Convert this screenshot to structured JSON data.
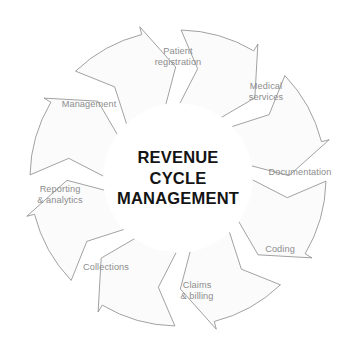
{
  "diagram": {
    "type": "circular-cycle",
    "title_lines": [
      "REVENUE",
      "CYCLE",
      "MANAGEMENT"
    ],
    "center_text": "REVENUE CYCLE MANAGEMENT",
    "direction": "clockwise",
    "segment_count": 8,
    "colors": {
      "arrow_fill": "#fbfbfb",
      "arrow_stroke": "#8a8a8a",
      "label_text": "#8d8d8d",
      "center_text": "#141414",
      "background": "#ffffff"
    },
    "segments": [
      {
        "id": "patient-registration",
        "label_lines": [
          "Patient",
          "registration"
        ],
        "label": "Patient registration",
        "order": 1,
        "label_x": 178,
        "label_y": 57
      },
      {
        "id": "medical-services",
        "label_lines": [
          "Medical",
          "services"
        ],
        "label": "Medical services",
        "order": 2,
        "label_x": 266,
        "label_y": 92
      },
      {
        "id": "documentation",
        "label_lines": [
          "Documentation"
        ],
        "label": "Documentation",
        "order": 3,
        "label_x": 300,
        "label_y": 173
      },
      {
        "id": "coding",
        "label_lines": [
          "Coding"
        ],
        "label": "Coding",
        "order": 4,
        "label_x": 280,
        "label_y": 250
      },
      {
        "id": "claims-billing",
        "label_lines": [
          "Claims",
          "& billing"
        ],
        "label": "Claims & billing",
        "order": 5,
        "label_x": 197,
        "label_y": 291
      },
      {
        "id": "collections",
        "label_lines": [
          "Collections"
        ],
        "label": "Collections",
        "order": 6,
        "label_x": 106,
        "label_y": 268
      },
      {
        "id": "reporting-analytics",
        "label_lines": [
          "Reporting",
          "& analytics"
        ],
        "label": "Reporting & analytics",
        "order": 7,
        "label_x": 60,
        "label_y": 195
      },
      {
        "id": "management",
        "label_lines": [
          "Management"
        ],
        "label": "Management",
        "order": 8,
        "label_x": 89,
        "label_y": 105
      }
    ],
    "geometry": {
      "center_x": 178,
      "center_y": 178,
      "inner_radius": 74,
      "outer_radius": 148,
      "hub_radius": 75
    }
  }
}
